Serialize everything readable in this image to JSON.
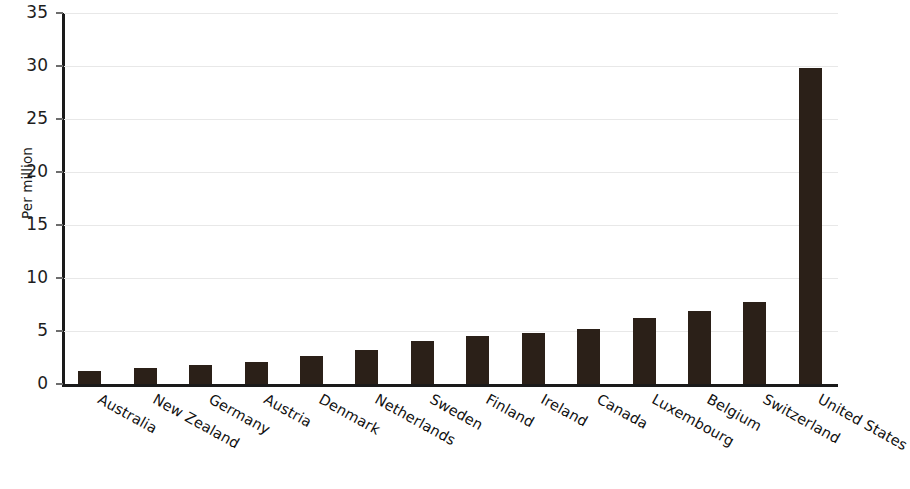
{
  "chart_data": {
    "type": "bar",
    "title": "",
    "subtitle": "",
    "xlabel": "",
    "ylabel": "Per million",
    "ylim": [
      0,
      35
    ],
    "yticks": [
      0,
      5,
      10,
      15,
      20,
      25,
      30,
      35
    ],
    "ytick_labels": [
      "0",
      "5",
      "10",
      "15",
      "20",
      "25",
      "30",
      "35"
    ],
    "grid": true,
    "grid_axis": "y",
    "legend": null,
    "bar_color": "#2b2018",
    "categories": [
      "Australia",
      "New Zealand",
      "Germany",
      "Austria",
      "Denmark",
      "Netherlands",
      "Sweden",
      "Finland",
      "Ireland",
      "Canada",
      "Luxembourg",
      "Belgium",
      "Switzerland",
      "United States"
    ],
    "values": [
      1.2,
      1.5,
      1.8,
      2.1,
      2.6,
      3.2,
      4.1,
      4.5,
      4.8,
      5.2,
      6.2,
      6.9,
      7.7,
      29.8
    ]
  }
}
